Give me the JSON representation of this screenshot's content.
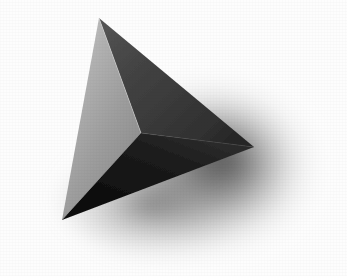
{
  "image": {
    "title": "Shaded tetrahedron on white background",
    "subject": "tetrahedron",
    "width": 347,
    "height": 276,
    "background_color": "#fdfdfd",
    "medium": "grayscale photograph / render with soft drop shadow"
  },
  "geometry": {
    "vertices": {
      "apex": {
        "label": "apex",
        "x": 99,
        "y": 18
      },
      "left": {
        "label": "left",
        "x": 62,
        "y": 220
      },
      "right": {
        "label": "right",
        "x": 254,
        "y": 147
      },
      "front": {
        "label": "front",
        "x": 141,
        "y": 133
      }
    },
    "edges": [
      {
        "name": "apex-front",
        "from": "apex",
        "to": "front"
      },
      {
        "name": "apex-left",
        "from": "apex",
        "to": "left"
      },
      {
        "name": "apex-right",
        "from": "apex",
        "to": "right"
      },
      {
        "name": "front-left",
        "from": "front",
        "to": "left"
      },
      {
        "name": "front-right",
        "from": "front",
        "to": "right"
      },
      {
        "name": "left-right",
        "from": "left",
        "to": "right"
      }
    ]
  },
  "faces": [
    {
      "name": "left-face",
      "label": "left light face",
      "vertices": [
        "apex",
        "front",
        "left"
      ],
      "points": "99,18 141,133 62,220",
      "fill_light": "#b4b4b4",
      "fill_dark": "#8d8d8d",
      "tone": "mid gray highlight"
    },
    {
      "name": "upper-right-face",
      "label": "upper right shaded face",
      "vertices": [
        "apex",
        "right",
        "front"
      ],
      "points": "99,18 254,147 141,133",
      "fill_light": "#4b4b4b",
      "fill_dark": "#2f2f2f",
      "tone": "dark gray"
    },
    {
      "name": "lower-face",
      "label": "lower dark face",
      "vertices": [
        "front",
        "right",
        "left"
      ],
      "points": "141,133 254,147 62,220",
      "fill_light": "#262626",
      "fill_dark": "#0b0b0b",
      "tone": "near black"
    }
  ],
  "shadow": {
    "name": "drop-shadow",
    "label": "soft cast shadow",
    "center_x": 205,
    "center_y": 168,
    "radius_x": 132,
    "radius_y": 104,
    "core_color": "#5b5b5b",
    "edge_color": "#ffffff",
    "opacity": 0.85
  },
  "colors": {
    "background": "#fdfdfd",
    "light_face": "#a3a3a3",
    "dark_face": "#3a3a3a",
    "darkest_face": "#141414",
    "shadow": "#6a6a6a"
  }
}
